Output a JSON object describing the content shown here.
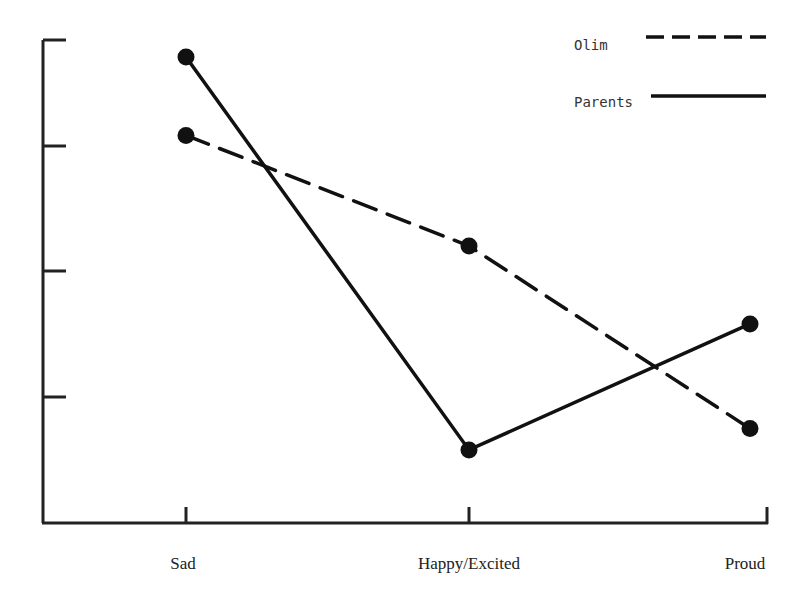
{
  "chart_data": {
    "type": "line",
    "title": "",
    "xlabel": "",
    "ylabel": "",
    "categories": [
      "Sad",
      "Happy/Excited",
      "Proud"
    ],
    "series": [
      {
        "name": "Olim",
        "style": "dashed",
        "values": [
          3.1,
          2.2,
          0.75
        ]
      },
      {
        "name": "Parents",
        "style": "solid",
        "values": [
          3.84,
          0.58,
          1.58
        ]
      }
    ],
    "y_ticks": [
      0,
      1,
      2,
      3,
      4
    ],
    "y_tick_labels_visible": false,
    "ylim": [
      0,
      4
    ],
    "grid": false,
    "legend_position": "top-right",
    "colors": {
      "line": "#111111",
      "axis": "#222222",
      "background": "#ffffff"
    }
  },
  "legend": {
    "items": [
      {
        "label": "Olim",
        "style": "dashed"
      },
      {
        "label": "Parents",
        "style": "solid"
      }
    ]
  },
  "x_axis": {
    "labels": [
      "Sad",
      "Happy/Excited",
      "Proud"
    ]
  }
}
